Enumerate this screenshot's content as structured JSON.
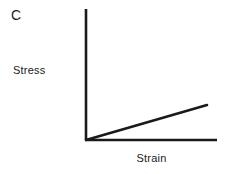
{
  "figure": {
    "panel_label": "C",
    "background_color": "#ffffff",
    "ink_color": "#1a1a1a",
    "width": 225,
    "height": 174
  },
  "chart_data": {
    "type": "line",
    "title": "C",
    "xlabel": "Strain",
    "ylabel": "Stress",
    "grid": false,
    "legend": false,
    "ticks": false,
    "xlim": [
      0,
      1
    ],
    "ylim": [
      0,
      1
    ],
    "axes": {
      "origin_px": [
        86,
        140
      ],
      "y_axis_top_px": [
        86,
        9
      ],
      "x_axis_right_px": [
        217,
        140
      ],
      "line_width_px": 2.6,
      "color": "#1a1a1a"
    },
    "series": [
      {
        "name": "linear elastic response",
        "color": "#1a1a1a",
        "line_width_px": 2.6,
        "x": [
          0,
          1
        ],
        "y": [
          0,
          0.277
        ],
        "points_px": [
          [
            86,
            140
          ],
          [
            207,
            105
          ]
        ],
        "slope": 0.277
      }
    ],
    "annotations": []
  }
}
